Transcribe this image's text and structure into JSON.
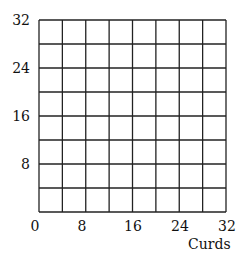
{
  "chart_data": {
    "type": "line",
    "title": "",
    "xlabel": "Curds",
    "ylabel": "",
    "xlim": [
      0,
      32
    ],
    "ylim": [
      0,
      32
    ],
    "x_ticks": [
      "0",
      "8",
      "16",
      "24",
      "32"
    ],
    "y_ticks": [
      "8",
      "16",
      "24",
      "32"
    ],
    "grid": true,
    "grid_step": 4,
    "series": [],
    "legend": null
  }
}
